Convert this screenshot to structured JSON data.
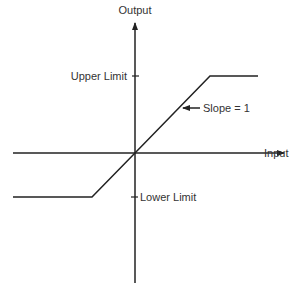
{
  "diagram": {
    "type": "saturation-transfer-function",
    "axes": {
      "y_label": "Output",
      "x_label": "Input"
    },
    "ticks": {
      "upper_limit": "Upper Limit",
      "lower_limit": "Lower Limit"
    },
    "annotation": {
      "slope_label": "Slope = 1"
    },
    "colors": {
      "line": "#222222",
      "text": "#333333",
      "background": "#ffffff"
    }
  }
}
